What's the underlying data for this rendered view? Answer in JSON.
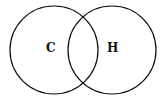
{
  "diagram": {
    "type": "venn",
    "sets": [
      {
        "label": "C",
        "cx": 54,
        "cy": 50,
        "r": 44
      },
      {
        "label": "H",
        "cx": 112,
        "cy": 50,
        "r": 44
      }
    ],
    "stroke_color": "#111111"
  }
}
